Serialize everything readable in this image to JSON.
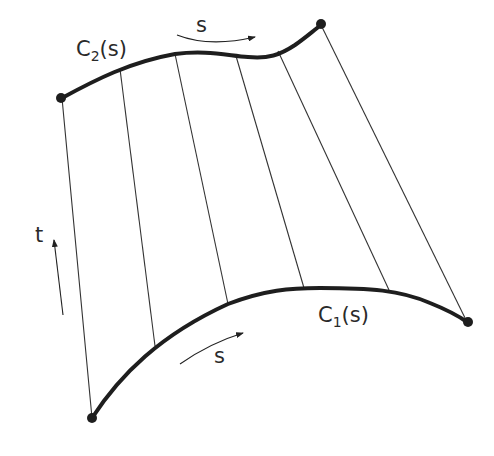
{
  "diagram": {
    "type": "ruled-surface",
    "colors": {
      "curve": "#1e1e1e",
      "ruling": "#333333",
      "text": "#2a2a2a",
      "background": "#ffffff"
    },
    "curves": [
      {
        "id": "C2",
        "label_main": "C",
        "label_sub": "2",
        "label_arg": "(s)",
        "role": "top boundary curve"
      },
      {
        "id": "C1",
        "label_main": "C",
        "label_sub": "1",
        "label_arg": "(s)",
        "role": "bottom boundary curve"
      }
    ],
    "arrows": [
      {
        "id": "s-top",
        "label": "s",
        "direction": "along C2"
      },
      {
        "id": "s-bottom",
        "label": "s",
        "direction": "along C1"
      },
      {
        "id": "t",
        "label": "t",
        "direction": "from C1 to C2"
      }
    ],
    "ruling_count": 6
  }
}
